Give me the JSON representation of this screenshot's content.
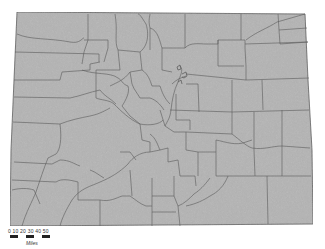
{
  "map": {
    "title": "Colorado Counties",
    "fill_color": "#b4b4b4",
    "border_color": "#555555"
  },
  "scale_bar": {
    "ticks": [
      "0",
      "10",
      "20",
      "30",
      "40",
      "50"
    ],
    "tick_label": "0  10 20  30  40  50",
    "unit": "Miles"
  }
}
